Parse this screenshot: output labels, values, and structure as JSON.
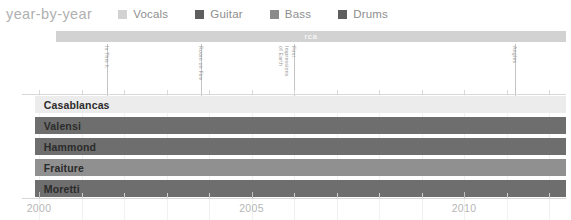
{
  "header": {
    "title": "year-by-year"
  },
  "legend": {
    "items": [
      {
        "label": "Vocals",
        "color": "#d2d2d2"
      },
      {
        "label": "Guitar",
        "color": "#5e5e5e"
      },
      {
        "label": "Bass",
        "color": "#8a8a8a"
      },
      {
        "label": "Drums",
        "color": "#5e5e5e"
      }
    ]
  },
  "chart_data": {
    "type": "bar",
    "title": "year-by-year",
    "xlabel": "",
    "ylabel": "",
    "xlim": [
      1999.6,
      2012.4
    ],
    "grid": true,
    "legend_position": "top",
    "categories": [
      "Casablancas",
      "Valensi",
      "Hammond",
      "Fraiture",
      "Moretti"
    ],
    "series": [
      {
        "name": "Vocals",
        "color": "#d2d2d2",
        "members": [
          "Casablancas"
        ]
      },
      {
        "name": "Guitar",
        "color": "#5e5e5e",
        "members": [
          "Valensi",
          "Hammond"
        ]
      },
      {
        "name": "Bass",
        "color": "#8a8a8a",
        "members": [
          "Fraiture"
        ]
      },
      {
        "name": "Drums",
        "color": "#5e5e5e",
        "members": [
          "Moretti"
        ]
      }
    ],
    "rows": [
      {
        "label": "Casablancas",
        "role": "Vocals",
        "color": "#ececec",
        "start": 1999.9,
        "end": 2012.4
      },
      {
        "label": "Valensi",
        "role": "Guitar",
        "color": "#6e6e6e",
        "start": 1999.9,
        "end": 2012.4
      },
      {
        "label": "Hammond",
        "role": "Guitar",
        "color": "#6e6e6e",
        "start": 1999.9,
        "end": 2012.4
      },
      {
        "label": "Fraiture",
        "role": "Bass",
        "color": "#909090",
        "start": 1999.9,
        "end": 2012.4
      },
      {
        "label": "Moretti",
        "role": "Drums",
        "color": "#6e6e6e",
        "start": 1999.9,
        "end": 2012.4
      }
    ],
    "eras": [
      {
        "label": "rca",
        "start": 2000.4,
        "end": 2012.4,
        "color": "#d2d2d2"
      }
    ],
    "albums": [
      {
        "label": "Is This It",
        "year": 2001.6
      },
      {
        "label": "Room on Fire",
        "year": 2003.8
      },
      {
        "label": "First Impressions of Earth",
        "year": 2006.0
      },
      {
        "label": "Angles",
        "year": 2011.2
      }
    ],
    "x_ticks_major": [
      2000,
      2005,
      2010
    ],
    "x_tick_labels": [
      "2000",
      "2005",
      "2010"
    ],
    "x_ticks_minor": [
      2001,
      2002,
      2003,
      2004,
      2006,
      2007,
      2008,
      2009,
      2011,
      2012
    ]
  }
}
